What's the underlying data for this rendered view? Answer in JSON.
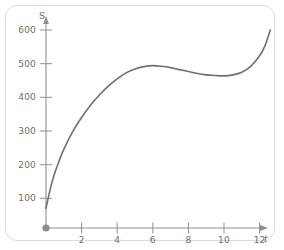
{
  "figure": {
    "frame_color": "#dcdcdc",
    "background": "#ffffff"
  },
  "chart_data": {
    "type": "line",
    "title": "",
    "subtitle": "",
    "xlabel": "t",
    "ylabel": "S",
    "xlim": [
      0,
      13.2
    ],
    "ylim": [
      0,
      640
    ],
    "grid": false,
    "legend": null,
    "curve_color": "#707070",
    "curve_width": 1.6,
    "origin_marker": {
      "label": "origin-dot",
      "x": 0,
      "y": 0,
      "color": "#8c8c8c"
    },
    "xticks": [
      2,
      4,
      6,
      8,
      10,
      12
    ],
    "xtick_labels": [
      "2",
      "4",
      "6",
      "8",
      "10",
      "12"
    ],
    "yticks": [
      100,
      200,
      300,
      400,
      500,
      600
    ],
    "ytick_labels": [
      "100",
      "200",
      "300",
      "400",
      "500",
      "600"
    ],
    "annotations": [],
    "x": [
      0,
      0.25,
      0.5,
      0.75,
      1,
      1.5,
      2,
      2.5,
      3,
      3.5,
      4,
      4.5,
      5,
      5.5,
      6,
      6.5,
      7,
      7.5,
      8,
      8.5,
      9,
      9.5,
      10,
      10.5,
      11,
      11.5,
      12,
      12.3,
      12.6
    ],
    "values": [
      60,
      120,
      168,
      205,
      238,
      292,
      335,
      372,
      403,
      430,
      452,
      470,
      482,
      489,
      492,
      490,
      486,
      480,
      474,
      468,
      464,
      462,
      461,
      464,
      472,
      490,
      522,
      552,
      600
    ],
    "series": [
      {
        "name": "S(t)",
        "color": "#707070",
        "values": [
          60,
          120,
          168,
          205,
          238,
          292,
          335,
          372,
          403,
          430,
          452,
          470,
          482,
          489,
          492,
          490,
          486,
          480,
          474,
          468,
          464,
          462,
          461,
          464,
          472,
          490,
          522,
          552,
          600
        ]
      }
    ],
    "features": {
      "start_value": 60,
      "local_max": {
        "t": 6,
        "S": 492
      },
      "local_min": {
        "t": 10,
        "S": 461
      },
      "end_value": 600
    }
  }
}
